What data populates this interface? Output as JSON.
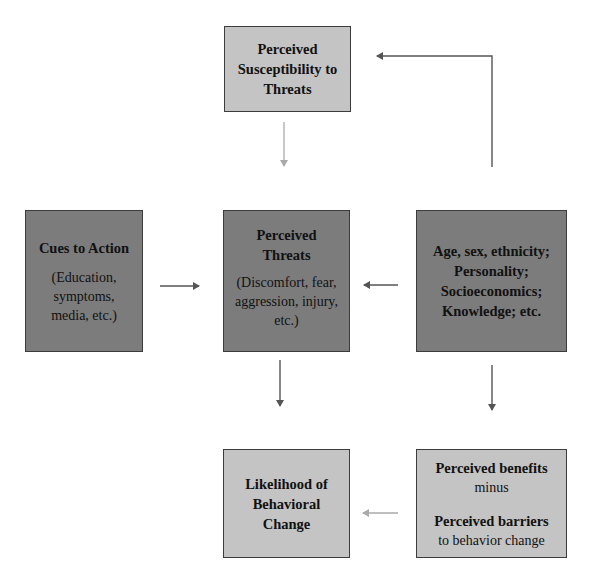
{
  "nodes": {
    "susceptibility": {
      "title": "Perceived Susceptibility to Threats",
      "lines": [
        "Perceived",
        "Susceptibility to",
        "Threats"
      ]
    },
    "cues": {
      "title": "Cues to Action",
      "detail": [
        "(Education,",
        "symptoms,",
        "media, etc.)"
      ]
    },
    "threats": {
      "title": [
        "Perceived",
        "Threats"
      ],
      "detail": [
        "(Discomfort, fear,",
        "aggression, injury,",
        "etc.)"
      ]
    },
    "demographics": {
      "lines": [
        "Age, sex, ethnicity;",
        "Personality;",
        "Socioeconomics;",
        "Knowledge; etc."
      ]
    },
    "likelihood": {
      "lines": [
        "Likelihood of",
        "Behavioral",
        "Change"
      ]
    },
    "benefits_barriers": {
      "benefits": "Perceived benefits",
      "minus": "minus",
      "barriers": "Perceived barriers",
      "barriers_sub": "to behavior change"
    }
  },
  "edges": [
    {
      "from": "demographics",
      "to": "susceptibility",
      "style": "dark",
      "shape": "elbow"
    },
    {
      "from": "susceptibility",
      "to": "threats",
      "style": "light"
    },
    {
      "from": "cues",
      "to": "threats",
      "style": "dark"
    },
    {
      "from": "demographics",
      "to": "threats",
      "style": "dark"
    },
    {
      "from": "threats",
      "to": "likelihood",
      "style": "dark"
    },
    {
      "from": "demographics",
      "to": "benefits_barriers",
      "style": "dark"
    },
    {
      "from": "benefits_barriers",
      "to": "likelihood",
      "style": "light"
    }
  ],
  "colors": {
    "light_box": "#c4c4c4",
    "dark_box": "#7c7c7c",
    "dark_arrow": "#555555",
    "light_arrow": "#aaaaaa"
  }
}
